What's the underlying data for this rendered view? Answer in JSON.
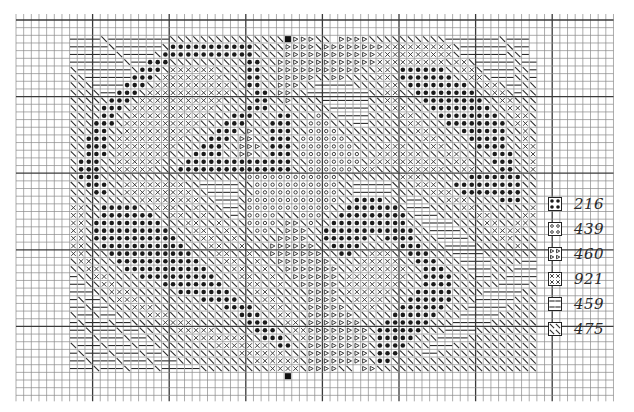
{
  "chart": {
    "title": "",
    "type": "cross-stitch pattern chart",
    "grid": {
      "origin_x": 16,
      "origin_y": 20,
      "cell": 7.66,
      "cols": 78,
      "rows": 49,
      "major_every": 10,
      "line_color": "#8a8a8a",
      "major_color": "#3a3a3a"
    },
    "center_markers": [
      {
        "position": "top",
        "col": 35,
        "row": 2
      },
      {
        "position": "bottom",
        "col": 35,
        "row": 46
      }
    ],
    "pattern_offset": {
      "col": 7,
      "row": 2
    },
    "symbol_key": {
      "D": "dot",
      "O": "circle",
      "T": "triangle",
      "X": "cross",
      "H": "dash",
      "S": "slash"
    },
    "pattern_rows": [
      "HHHHSHHHHHHHHSSSSSSSSSSSSSSSTTTTSS.TTTTSSSSSSSSSSHHHHHHHSHHH",
      "HHHHHSHHHHHHSDDDDDDDDDDDSSSSTTTTSTTTTTTTTXXXXXXXXXSHHHHHHSHH",
      "HHHHHHSHHHHSDDDDDDDDDDDDSSSSTTTTTTTTTTTTXXXXXXXXXXSHHHHHHSSH",
      "HHHHHHHSHHDDDSSSSSSSSSSDDSSTTTTTTTTTTTTTXXXXXXXXXSXXSHHHHHSHH",
      "SHHHHHHHSDDDSXXXXXXSSSSDDSSTTTTTTTTTTTSSXXSDDDDDDSSXXSHHHHSSH",
      "SSHHHHHHDDDSXXXXXXXXSSSDDSSTTTTTSSTTSSSSXXSDDDDDDDSSXXSHHHSSH",
      "SSSHHHHDDDSXXXXXXXXXXSSDDSSTTTSSHHHHHSSSSXXSDDDDDDDDSSXXSHHSS",
      "SSSSHHDDDSXXXXXXXXXXXSSSDDSTTSSHHHHHHHHSSXXSSDDDDDDDDSSXXSHSS",
      "SSSSSDDDSXXXXXXXXXXXSSSSDDSSTSSSSHHHHHHSSXXSSSDDDDDDDDSSXXSSS",
      "SSSSDDDSXXXXXXXXXXXSSSSDDDSSSSSSSSHHHHHSSSXXSSSDDDDDDDDSSXXSS",
      "SSSSDDSSXXXXXXXXXXSSSDDDSSSDDSSSOSSHHHHSSSSXXSSSDDDDDDDDSSXXS",
      "SSSDDDSXXXXXXXXXXSSSDDDSSSDDDSSOOOSSSHHSSSSSXXSSSDDDDDDDDSXXS",
      "SSSDDSSXXXXXXXXXSSSDDDSTSSDDDSSOOOOSSSSSSSSSSXXSSSSDDDDDDSSXS",
      "SSDDDSXXXXXXXXXSSSDDDSTTSSDDDSOOOOOOSSSSSSSSSSXXSSSSDDDDDSSXS",
      "SSDDDSXXXXXXXXSSSDDDSSTTTSDDDSOOOOOOOSSSSXXXSSSXXSSSSDDDDSSXX",
      "SSDDDSXXXXXXXSSSDDDDSSTTSSDDDSOOOOOOOOSSXXXXXXSSSXXSSSSDDDSSX",
      "SDDDSSXXXXXXSSSDDDDDDDDDDDDDDSSOOOOOOOSXXXXXXXXXSSXXSSSDDDSSX",
      "SDDDSSXXXXXSSSDDDDDDDDDDDDDDDSSOOOOOOSXXSSSSXXXXXSSXXSSSDDSSX",
      "SDDDSSSSSSSSSSSSSSSSSSSOOOOOOOOOOOOSSSSSSSSXXXSSSSSSDDDDDDDSS",
      "SSDDDSSXXXXXXXXSSHHHHHSSOOOOOOOOOOOSSHHHHHSSSXXXSSDDDDDDDDDSS",
      "SSSDDSSXXXXXXXXXSSHHHHSSOOOOOOOOOOOSSHHHHHSSSSSXXXSDDDDDDDDSS",
      "SSSSSSSSSXXXXXXXXSSHHHSOOOOOOOOOOOOSSDDDDSSSHHSSSXXXSSSSDDDSS",
      "XXSSDDDDDSSXXXSSXSSSHHSOOOOOOOOOOOSSDDDDDDDSHHHSSSSXXSSSSSSSX",
      "XXSSDDDDDDDSSXXSSXSSSHSOOOOSSSOOOSSDDDDDDDDDSHHHSSSSSXXSSSSXX",
      "XXSDDDDDDDDDSSSXXSSXSSSOOOOSTTSOSSDDDDDDDDDDSSHHHHSSSSXXSSXXS",
      "XXSDDDDDDDDDDSSSXXSSXSSSOOSSTTTSSDDDDDDDDDDDDSSHHHHSSSSXXXXSS",
      "XXSDDDDDDDDDDDSSSXXSSXSSSSSTTTTSSDDDDDDSSDDDDSSSHHHHSSSSXXSSS",
      "XXSSDDDDDDDDDDDSSSXXSSXSSSTTTTTTSSDDDDSSSSSDDDSSSHHHHSSSSSXSS",
      "XXSSSDDDDDDDDDDDSSSXXSSXSSTTTTTTTSSDDSSXXXSSDDDSSSHHHHSSSSSSS",
      "SXXSSSDDDDDDDDDDDSSSXXSSXSSTTTTTTTSSSSXXXXXSSDDDSSSHHHHSSSSHH",
      "SSXXSSSDDDDDDDDDDDSSSXXSSXSSTTTTTTTSSXXXXXXXSSDDDSSSHHHSSSHHH",
      "HSSXXSSSSDDDDDDDDDDSSSXXSSXSSTTTTTTSXXXXXXXXSSDDDDSSSHHSSHHHH",
      "HHSSXXSSSSSSDDDDDDDDSSSXXSSXSSTTTTTSXXXXXXXSSSDDDDSSSSSSHHHHS",
      "HHHSSXXXSSSSSSDDDDDDDSSSXXSSSSSTTTTSXXXXXXSSSDDDDDSSSSHHHHHSS",
      "HSHHSSXXXSSSSSSSSDDDDDSSSXXSSSSTTTTSSXXXXSSSDDDDDDSSSHHHHHSSS",
      "HHSHHSSSXXXSSSSSSSSSDDDDSSXXSSSTTTTTSSXXSSSDDDDDDSSSHHHHHSSSS",
      "SHHSHHSSSSXXXSSSSSSSSSDDDSSXXSSTTTTTTSSSSSDDDDDDSSSHHHHHSSSSS",
      "HSHHHSHHSSSSXXXXSSSSSSSDDDSSXXSTTTTTTTSSSDDDDDDSSSHHHHHSSSSSS",
      "HHSHHHSHHSSSSSXXXXXSSSSSDDDSSXXTTTTTTTTSDDDDDDSSSHHHHSSSSSSSS",
      "HHHSHHHSHHSSSSSSXXXXXXXSSDDDSSXTTTTTTTTSDDDDDSSSHHHHSSSSSSSSS",
      "SHHHSHHHSHHSSSSSSSSXXXXXXXSDDSSTTTTTTTTSDDDDSSSHHHSSSSSSSSSSS",
      "HSHHHSHHHSHHSSSSSSSSSSXXXXXXSSSTTTTTTTTSDDDSSSHHSSSSSSSSSSSSS",
      "HHSHHHSHHHSHHHSSSSSSSSSSXXXXXXSTTTTTTTTSDDSSSSSSSSSSSSSSSSSSS",
      "HHHSHHHSHHHSHHHHHSSSSSSSSSXXXXSTTTTSS.TTSSSSSSSSSSSSSSSSSSSSS"
    ],
    "legend": [
      {
        "symbol": "D",
        "symbol_name": "dot",
        "code": "216"
      },
      {
        "symbol": "O",
        "symbol_name": "circle",
        "code": "439"
      },
      {
        "symbol": "T",
        "symbol_name": "triangle",
        "code": "460"
      },
      {
        "symbol": "X",
        "symbol_name": "cross",
        "code": "921"
      },
      {
        "symbol": "H",
        "symbol_name": "dash",
        "code": "459"
      },
      {
        "symbol": "S",
        "symbol_name": "slash",
        "code": "475"
      }
    ]
  }
}
